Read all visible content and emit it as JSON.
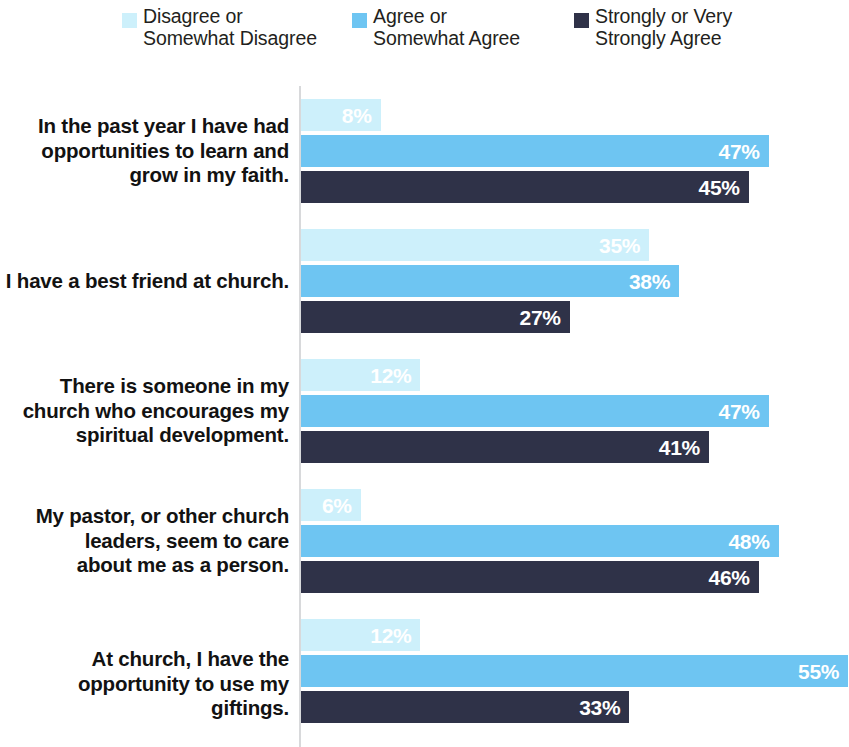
{
  "legend": {
    "items": [
      {
        "label": "Disagree or\nSomewhat Disagree",
        "color": "#cdf0fb",
        "name": "legend-disagree"
      },
      {
        "label": "Agree or\nSomewhat Agree",
        "color": "#6ec5f2",
        "name": "legend-agree"
      },
      {
        "label": "Strongly or Very\nStrongly Agree",
        "color": "#2f3248",
        "name": "legend-strongly-agree"
      }
    ]
  },
  "chart_data": {
    "type": "bar",
    "orientation": "horizontal",
    "title": "",
    "subtitle": "",
    "xlabel": "",
    "ylabel": "",
    "xlim": [
      0,
      85
    ],
    "grid": false,
    "legend_position": "top",
    "value_suffix": "%",
    "categories": [
      "In the past year I have had\nopportunities to learn and\ngrow in my faith.",
      "I have a best friend at church.",
      "There is someone in my\nchurch who encourages my\nspiritual development.",
      "My pastor, or other church\nleaders, seem to care\nabout me as a person.",
      "At church, I have the\nopportunity to use my giftings."
    ],
    "series": [
      {
        "name": "Disagree or Somewhat Disagree",
        "color": "#cdf0fb",
        "values": [
          8,
          35,
          12,
          6,
          12
        ],
        "labels": [
          "8%",
          "35%",
          "12%",
          "6%",
          "12%"
        ]
      },
      {
        "name": "Agree or Somewhat Agree",
        "color": "#6ec5f2",
        "values": [
          47,
          38,
          47,
          48,
          55
        ],
        "labels": [
          "47%",
          "38%",
          "47%",
          "48%",
          "55%"
        ]
      },
      {
        "name": "Strongly or Very Strongly Agree",
        "color": "#2f3248",
        "values": [
          45,
          27,
          41,
          46,
          33
        ],
        "labels": [
          "45%",
          "27%",
          "41%",
          "46%",
          "33%"
        ]
      }
    ]
  },
  "axis": {
    "color": "#d8d9db"
  }
}
